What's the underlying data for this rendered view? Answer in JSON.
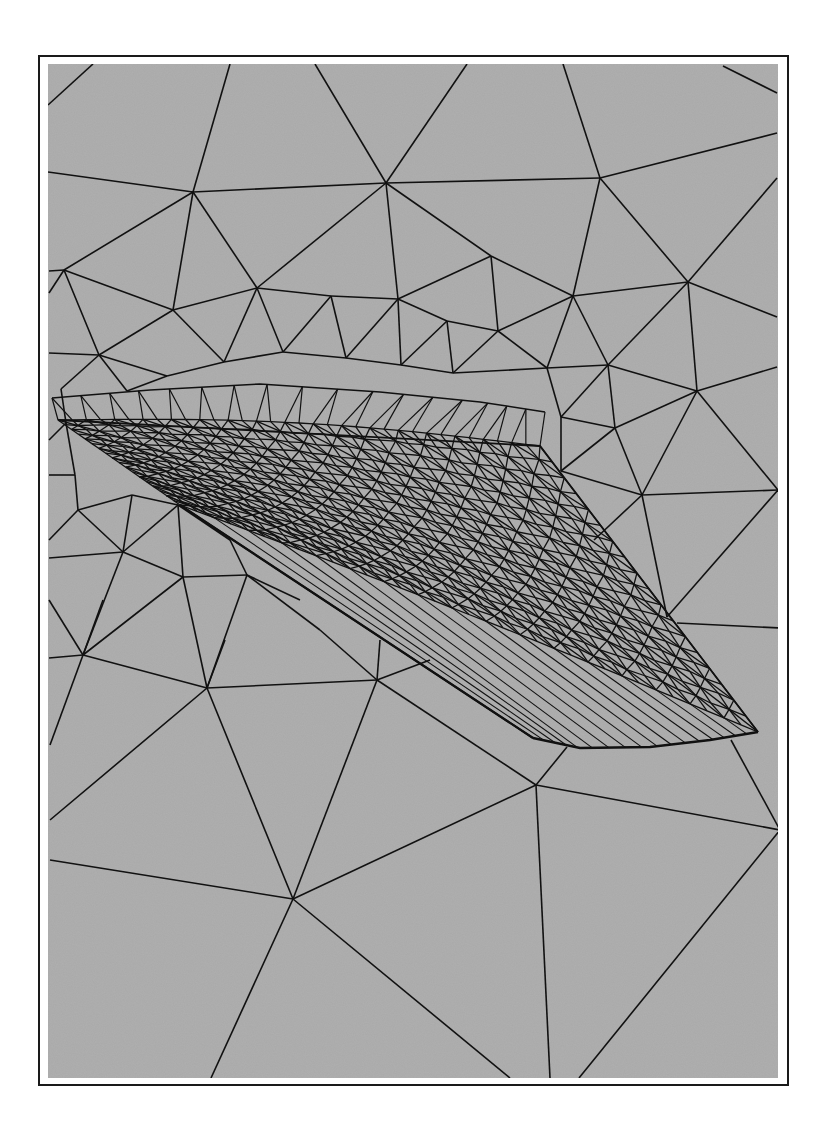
{
  "figure": {
    "type": "unstructured triangular surface mesh",
    "colors": {
      "background": "#a9a9a9",
      "edges": "#111111",
      "frame": "#1a1a1a",
      "page": "#ffffff"
    },
    "plot_area": {
      "x": 48,
      "y": 64,
      "width": 730,
      "height": 1014
    }
  },
  "coarse_mesh": {
    "edges": [
      [
        [
          48,
          105
        ],
        [
          93,
          64
        ]
      ],
      [
        [
          48,
          172
        ],
        [
          193,
          192
        ]
      ],
      [
        [
          193,
          192
        ],
        [
          230,
          64
        ]
      ],
      [
        [
          193,
          192
        ],
        [
          386,
          183
        ]
      ],
      [
        [
          386,
          183
        ],
        [
          315,
          64
        ]
      ],
      [
        [
          386,
          183
        ],
        [
          467,
          64
        ]
      ],
      [
        [
          386,
          183
        ],
        [
          600,
          178
        ]
      ],
      [
        [
          600,
          178
        ],
        [
          563,
          64
        ]
      ],
      [
        [
          600,
          178
        ],
        [
          777,
          133
        ]
      ],
      [
        [
          723,
          66
        ],
        [
          777,
          93
        ]
      ],
      [
        [
          193,
          192
        ],
        [
          64,
          270
        ]
      ],
      [
        [
          193,
          192
        ],
        [
          173,
          310
        ]
      ],
      [
        [
          193,
          192
        ],
        [
          257,
          288
        ]
      ],
      [
        [
          386,
          183
        ],
        [
          257,
          288
        ]
      ],
      [
        [
          386,
          183
        ],
        [
          398,
          299
        ]
      ],
      [
        [
          386,
          183
        ],
        [
          491,
          256
        ]
      ],
      [
        [
          600,
          178
        ],
        [
          573,
          296
        ]
      ],
      [
        [
          600,
          178
        ],
        [
          688,
          282
        ]
      ],
      [
        [
          777,
          178
        ],
        [
          688,
          282
        ]
      ],
      [
        [
          777,
          317
        ],
        [
          688,
          282
        ]
      ],
      [
        [
          491,
          256
        ],
        [
          398,
          299
        ]
      ],
      [
        [
          491,
          256
        ],
        [
          573,
          296
        ]
      ],
      [
        [
          491,
          256
        ],
        [
          498,
          331
        ]
      ],
      [
        [
          573,
          296
        ],
        [
          688,
          282
        ]
      ],
      [
        [
          573,
          296
        ],
        [
          498,
          331
        ]
      ],
      [
        [
          573,
          296
        ],
        [
          547,
          368
        ]
      ],
      [
        [
          573,
          296
        ],
        [
          608,
          365
        ]
      ],
      [
        [
          688,
          282
        ],
        [
          608,
          365
        ]
      ],
      [
        [
          688,
          282
        ],
        [
          697,
          391
        ]
      ],
      [
        [
          49,
          271
        ],
        [
          64,
          270
        ]
      ],
      [
        [
          49,
          293
        ],
        [
          64,
          270
        ]
      ],
      [
        [
          64,
          270
        ],
        [
          173,
          310
        ]
      ],
      [
        [
          64,
          270
        ],
        [
          99,
          355
        ]
      ],
      [
        [
          173,
          310
        ],
        [
          257,
          288
        ]
      ],
      [
        [
          173,
          310
        ],
        [
          99,
          355
        ]
      ],
      [
        [
          173,
          310
        ],
        [
          224,
          362
        ]
      ],
      [
        [
          257,
          288
        ],
        [
          331,
          296
        ]
      ],
      [
        [
          257,
          288
        ],
        [
          224,
          362
        ]
      ],
      [
        [
          257,
          288
        ],
        [
          283,
          352
        ]
      ],
      [
        [
          331,
          296
        ],
        [
          398,
          299
        ]
      ],
      [
        [
          331,
          296
        ],
        [
          283,
          352
        ]
      ],
      [
        [
          331,
          296
        ],
        [
          346,
          358
        ]
      ],
      [
        [
          398,
          299
        ],
        [
          447,
          321
        ]
      ],
      [
        [
          398,
          299
        ],
        [
          346,
          358
        ]
      ],
      [
        [
          398,
          299
        ],
        [
          401,
          365
        ]
      ],
      [
        [
          447,
          321
        ],
        [
          498,
          331
        ]
      ],
      [
        [
          447,
          321
        ],
        [
          401,
          365
        ]
      ],
      [
        [
          447,
          321
        ],
        [
          453,
          373
        ]
      ],
      [
        [
          498,
          331
        ],
        [
          547,
          368
        ]
      ],
      [
        [
          498,
          331
        ],
        [
          453,
          373
        ]
      ],
      [
        [
          547,
          368
        ],
        [
          608,
          365
        ]
      ],
      [
        [
          608,
          365
        ],
        [
          697,
          391
        ]
      ],
      [
        [
          608,
          365
        ],
        [
          561,
          417
        ]
      ],
      [
        [
          608,
          365
        ],
        [
          615,
          428
        ]
      ],
      [
        [
          697,
          391
        ],
        [
          777,
          367
        ]
      ],
      [
        [
          697,
          391
        ],
        [
          615,
          428
        ]
      ],
      [
        [
          697,
          391
        ],
        [
          642,
          495
        ]
      ],
      [
        [
          697,
          391
        ],
        [
          778,
          490
        ]
      ],
      [
        [
          547,
          368
        ],
        [
          561,
          417
        ]
      ],
      [
        [
          561,
          417
        ],
        [
          615,
          428
        ]
      ],
      [
        [
          561,
          417
        ],
        [
          561,
          471
        ]
      ],
      [
        [
          615,
          428
        ],
        [
          561,
          471
        ]
      ],
      [
        [
          615,
          428
        ],
        [
          642,
          495
        ]
      ],
      [
        [
          561,
          471
        ],
        [
          642,
          495
        ]
      ],
      [
        [
          642,
          495
        ],
        [
          778,
          490
        ]
      ],
      [
        [
          642,
          495
        ],
        [
          594,
          540
        ]
      ],
      [
        [
          642,
          495
        ],
        [
          667,
          617
        ]
      ],
      [
        [
          778,
          490
        ],
        [
          667,
          617
        ]
      ],
      [
        [
          677,
          623
        ],
        [
          780,
          628
        ]
      ],
      [
        [
          49,
          353
        ],
        [
          99,
          355
        ]
      ],
      [
        [
          99,
          355
        ],
        [
          167,
          376
        ]
      ],
      [
        [
          99,
          355
        ],
        [
          61,
          389
        ]
      ],
      [
        [
          99,
          355
        ],
        [
          127,
          391
        ]
      ],
      [
        [
          167,
          376
        ],
        [
          224,
          362
        ]
      ],
      [
        [
          167,
          376
        ],
        [
          127,
          391
        ]
      ],
      [
        [
          224,
          362
        ],
        [
          283,
          352
        ]
      ],
      [
        [
          283,
          352
        ],
        [
          346,
          358
        ]
      ],
      [
        [
          346,
          358
        ],
        [
          401,
          365
        ]
      ],
      [
        [
          401,
          365
        ],
        [
          453,
          373
        ]
      ],
      [
        [
          453,
          373
        ],
        [
          547,
          368
        ]
      ],
      [
        [
          61,
          389
        ],
        [
          66,
          423
        ]
      ],
      [
        [
          66,
          423
        ],
        [
          75,
          475
        ]
      ],
      [
        [
          75,
          475
        ],
        [
          78,
          510
        ]
      ],
      [
        [
          49,
          440
        ],
        [
          66,
          423
        ]
      ],
      [
        [
          49,
          475
        ],
        [
          75,
          475
        ]
      ],
      [
        [
          78,
          510
        ],
        [
          132,
          495
        ]
      ],
      [
        [
          78,
          510
        ],
        [
          123,
          552
        ]
      ],
      [
        [
          49,
          540
        ],
        [
          78,
          510
        ]
      ],
      [
        [
          132,
          495
        ],
        [
          178,
          505
        ]
      ],
      [
        [
          132,
          495
        ],
        [
          123,
          552
        ]
      ],
      [
        [
          178,
          505
        ],
        [
          123,
          552
        ]
      ],
      [
        [
          178,
          505
        ],
        [
          183,
          577
        ]
      ],
      [
        [
          178,
          505
        ],
        [
          230,
          540
        ]
      ],
      [
        [
          123,
          552
        ],
        [
          183,
          577
        ]
      ],
      [
        [
          49,
          558
        ],
        [
          123,
          552
        ]
      ],
      [
        [
          123,
          552
        ],
        [
          83,
          655
        ]
      ],
      [
        [
          183,
          577
        ],
        [
          247,
          575
        ]
      ],
      [
        [
          183,
          577
        ],
        [
          83,
          655
        ]
      ],
      [
        [
          183,
          577
        ],
        [
          207,
          688
        ]
      ],
      [
        [
          230,
          540
        ],
        [
          247,
          575
        ]
      ],
      [
        [
          247,
          575
        ],
        [
          207,
          688
        ]
      ],
      [
        [
          247,
          575
        ],
        [
          300,
          600
        ]
      ],
      [
        [
          247,
          575
        ],
        [
          320,
          630
        ]
      ],
      [
        [
          49,
          600
        ],
        [
          83,
          655
        ]
      ],
      [
        [
          49,
          658
        ],
        [
          83,
          655
        ]
      ],
      [
        [
          83,
          655
        ],
        [
          207,
          688
        ]
      ],
      [
        [
          83,
          655
        ],
        [
          50,
          745
        ]
      ],
      [
        [
          83,
          655
        ],
        [
          103,
          600
        ]
      ],
      [
        [
          207,
          688
        ],
        [
          377,
          680
        ]
      ],
      [
        [
          207,
          688
        ],
        [
          50,
          820
        ]
      ],
      [
        [
          207,
          688
        ],
        [
          293,
          899
        ]
      ],
      [
        [
          207,
          688
        ],
        [
          225,
          640
        ]
      ],
      [
        [
          377,
          680
        ],
        [
          320,
          630
        ]
      ],
      [
        [
          377,
          680
        ],
        [
          380,
          640
        ]
      ],
      [
        [
          377,
          680
        ],
        [
          536,
          785
        ]
      ],
      [
        [
          377,
          680
        ],
        [
          293,
          899
        ]
      ],
      [
        [
          377,
          680
        ],
        [
          430,
          660
        ]
      ],
      [
        [
          536,
          785
        ],
        [
          567,
          747
        ]
      ],
      [
        [
          536,
          785
        ],
        [
          780,
          830
        ]
      ],
      [
        [
          536,
          785
        ],
        [
          293,
          899
        ]
      ],
      [
        [
          536,
          785
        ],
        [
          550,
          1078
        ]
      ],
      [
        [
          731,
          740
        ],
        [
          780,
          830
        ]
      ],
      [
        [
          780,
          830
        ],
        [
          579,
          1078
        ]
      ],
      [
        [
          780,
          830
        ],
        [
          780,
          850
        ]
      ],
      [
        [
          50,
          860
        ],
        [
          293,
          899
        ]
      ],
      [
        [
          293,
          899
        ],
        [
          211,
          1078
        ]
      ],
      [
        [
          293,
          899
        ],
        [
          510,
          1078
        ]
      ]
    ]
  },
  "wing_mesh": {
    "corners": {
      "root_top": [
        58,
        420
      ],
      "tip_top": [
        540,
        446
      ],
      "tip_bottom": [
        758,
        732
      ],
      "root_bottom": [
        180,
        505
      ]
    },
    "leading_edge_tip": [
      533,
      738
    ],
    "chordwise_divisions": 34,
    "spanwise_divisions": 18,
    "fuselage_curve": [
      [
        52,
        398
      ],
      [
        150,
        390
      ],
      [
        260,
        384
      ],
      [
        380,
        392
      ],
      [
        480,
        402
      ],
      [
        545,
        412
      ]
    ],
    "tip_section": [
      [
        533,
        738
      ],
      [
        580,
        748
      ],
      [
        650,
        747
      ],
      [
        710,
        740
      ],
      [
        758,
        732
      ]
    ]
  }
}
